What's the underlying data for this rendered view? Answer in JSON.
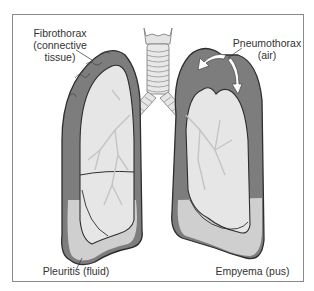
{
  "diagram": {
    "labels": {
      "fibrothorax": {
        "line1": "Fibrothorax",
        "line2": "(connective",
        "line3": "tissue)"
      },
      "pneumothorax": {
        "line1": "Pneumothorax",
        "line2": "(air)"
      },
      "pleuritis": {
        "line1": "Pleuritis (fluid)"
      },
      "empyema": {
        "line1": "Empyema (pus)"
      }
    },
    "colors": {
      "pleura_dark": "#7d7d7d",
      "fluid_light": "#c8c8c8",
      "lung_tissue": "#e6e6e6",
      "outline": "#2e2e2e",
      "frame": "#8a8a8a",
      "text": "#333333"
    }
  }
}
